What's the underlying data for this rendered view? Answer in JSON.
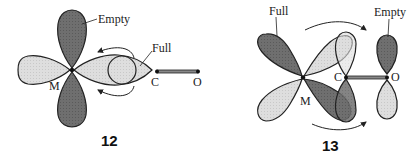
{
  "diagrams": [
    {
      "id": "12",
      "number": "12",
      "labels": {
        "empty": "Empty",
        "full": "Full",
        "metal": "M",
        "carbon": "C",
        "oxygen": "O"
      },
      "description": "Sigma donation: filled CO lone pair orbital donates to empty metal d orbital"
    },
    {
      "id": "13",
      "number": "13",
      "labels": {
        "full": "Full",
        "empty": "Empty",
        "metal": "M",
        "carbon": "C",
        "oxygen": "O"
      },
      "description": "Pi back-donation: filled metal d orbital donates to empty CO pi* orbital"
    }
  ],
  "colors": {
    "dark_lobe": "#6f6f6f",
    "light_lobe": "#dcdcdc",
    "outline": "#222222",
    "bond": "#888888"
  }
}
